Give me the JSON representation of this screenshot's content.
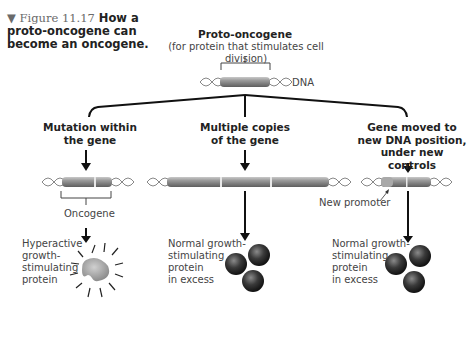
{
  "figure": {
    "number": "▼ Figure 11.17",
    "title": "How a proto-oncogene can become an oncogene."
  },
  "top": {
    "title": "Proto-oncogene",
    "subtitle": "(for protein that stimulates cell division)",
    "dna_label": "DNA"
  },
  "branches": [
    {
      "heading_line1": "Mutation within",
      "heading_line2": "the gene",
      "gene_label": "Oncogene",
      "result_lines": [
        "Hyperactive",
        "growth-",
        "stimulating",
        "protein"
      ]
    },
    {
      "heading_line1": "Multiple copies",
      "heading_line2": "of the gene",
      "result_lines": [
        "Normal growth-",
        "stimulating",
        "protein",
        "in excess"
      ]
    },
    {
      "heading_line1": "Gene moved to",
      "heading_line2": "new DNA position,",
      "heading_line3": "under new controls",
      "promoter_label": "New promoter",
      "result_lines": [
        "Normal growth-",
        "stimulating",
        "protein",
        "in excess"
      ]
    }
  ],
  "colors": {
    "gene": "#8a8a8a",
    "protein_dark": "#2b2b2b",
    "text": "#222222"
  }
}
